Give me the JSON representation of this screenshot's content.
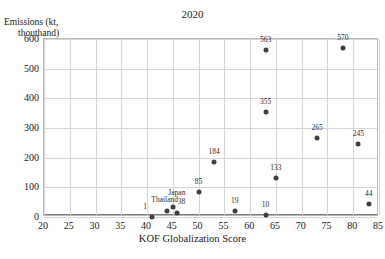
{
  "chart_data": {
    "type": "scatter",
    "title": "2020",
    "xlabel": "KOF Globalization Score",
    "ylabel": "Emissions (kt, thouthand)",
    "ylabel_line1": "Emissions (kt,",
    "ylabel_line2": "thouthand)",
    "xlim": [
      20,
      85
    ],
    "ylim": [
      0,
      600
    ],
    "xticks": [
      20,
      25,
      30,
      35,
      40,
      45,
      50,
      55,
      60,
      65,
      70,
      75,
      80,
      85
    ],
    "yticks": [
      0,
      100,
      200,
      300,
      400,
      500,
      600
    ],
    "grid": true,
    "legend": "none",
    "marker_color": "#404040",
    "points": [
      {
        "x": 41.0,
        "y": 1,
        "label": "1",
        "label_dx": -7,
        "label_dy": -2
      },
      {
        "x": 43.8,
        "y": 19,
        "label": "Thailand",
        "label_dx": -2,
        "label_dy": -3
      },
      {
        "x": 45.0,
        "y": 33,
        "label": "Japan",
        "label_dx": 4,
        "label_dy": -6
      },
      {
        "x": 45.9,
        "y": 14,
        "label": "38",
        "label_dx": 4,
        "label_dy": -3
      },
      {
        "x": 50.0,
        "y": 85,
        "label": "85",
        "label_dx": 0,
        "label_dy": -2
      },
      {
        "x": 53.0,
        "y": 184,
        "label": "184",
        "label_dx": 0,
        "label_dy": -2
      },
      {
        "x": 57.0,
        "y": 19,
        "label": "19",
        "label_dx": 0,
        "label_dy": -2
      },
      {
        "x": 63.0,
        "y": 7,
        "label": "10",
        "label_dx": 0,
        "label_dy": -2
      },
      {
        "x": 63.0,
        "y": 355,
        "label": "355",
        "label_dx": 0,
        "label_dy": -2
      },
      {
        "x": 63.0,
        "y": 563,
        "label": "563",
        "label_dx": 0,
        "label_dy": -2
      },
      {
        "x": 65.0,
        "y": 133,
        "label": "133",
        "label_dx": 0,
        "label_dy": -2
      },
      {
        "x": 73.0,
        "y": 265,
        "label": "265",
        "label_dx": 0,
        "label_dy": -2
      },
      {
        "x": 78.0,
        "y": 570,
        "label": "570",
        "label_dx": 0,
        "label_dy": -2
      },
      {
        "x": 81.0,
        "y": 245,
        "label": "245",
        "label_dx": 0,
        "label_dy": -2
      },
      {
        "x": 83.0,
        "y": 44,
        "label": "44",
        "label_dx": 0,
        "label_dy": -2
      }
    ]
  }
}
